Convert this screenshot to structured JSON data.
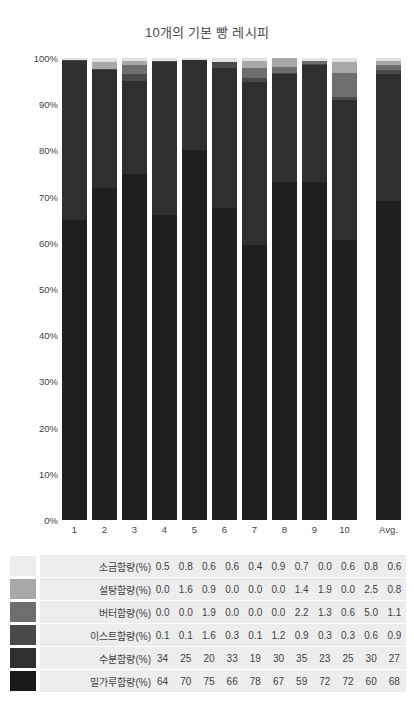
{
  "chart_data": {
    "type": "bar",
    "title": "10개의 기본 빵 레시피",
    "xlabel": "",
    "ylabel": "",
    "ylim": [
      0,
      100
    ],
    "grid": false,
    "stacked": true,
    "normalized": true,
    "legend_position": "bottom-table",
    "categories": [
      "1",
      "2",
      "3",
      "4",
      "5",
      "6",
      "7",
      "8",
      "9",
      "10",
      "Avg."
    ],
    "ytick_labels": [
      "0%",
      "10%",
      "20%",
      "30%",
      "40%",
      "50%",
      "60%",
      "70%",
      "80%",
      "90%",
      "100%"
    ],
    "ytick_values": [
      0,
      10,
      20,
      30,
      40,
      50,
      60,
      70,
      80,
      90,
      100
    ],
    "series": [
      {
        "name": "밀가루함량(%)",
        "color": "#1f1f1f",
        "values": [
          64,
          70,
          75,
          66,
          78,
          67,
          59,
          72,
          72,
          60,
          68
        ]
      },
      {
        "name": "수분함량(%)",
        "color": "#2f2f2f",
        "values": [
          34,
          25,
          20,
          33,
          19,
          30,
          35,
          23,
          25,
          30,
          27
        ]
      },
      {
        "name": "이스트함량(%)",
        "color": "#4a4a4a",
        "values": [
          0.1,
          0.1,
          1.6,
          0.3,
          0.1,
          1.2,
          0.9,
          0.3,
          0.3,
          0.6,
          0.9
        ]
      },
      {
        "name": "버터함량(%)",
        "color": "#6e6e6e",
        "values": [
          0.0,
          0.0,
          1.9,
          0.0,
          0.0,
          0.0,
          2.2,
          1.3,
          0.6,
          5.0,
          1.1
        ]
      },
      {
        "name": "설탕함량(%)",
        "color": "#a8a8a8",
        "values": [
          0.0,
          1.6,
          0.9,
          0.0,
          0.0,
          0.0,
          1.4,
          1.9,
          0.0,
          2.5,
          0.8
        ]
      },
      {
        "name": "소금함량(%)",
        "color": "#e2e2e2",
        "values": [
          0.5,
          0.8,
          0.6,
          0.6,
          0.4,
          0.9,
          0.7,
          0.0,
          0.6,
          0.8,
          0.6
        ]
      }
    ]
  },
  "legend_table": {
    "rows": [
      {
        "label": "소금함량(%)",
        "color": "#ededed",
        "values": [
          "0.5",
          "0.8",
          "0.6",
          "0.6",
          "0.4",
          "0.9",
          "0.7",
          "0.0",
          "0.6",
          "0.8",
          "0.6"
        ]
      },
      {
        "label": "설탕함량(%)",
        "color": "#a8a8a8",
        "values": [
          "0.0",
          "1.6",
          "0.9",
          "0.0",
          "0.0",
          "0.0",
          "1.4",
          "1.9",
          "0.0",
          "2.5",
          "0.8"
        ]
      },
      {
        "label": "버터함량(%)",
        "color": "#6e6e6e",
        "values": [
          "0.0",
          "0.0",
          "1.9",
          "0.0",
          "0.0",
          "0.0",
          "2.2",
          "1.3",
          "0.6",
          "5.0",
          "1.1"
        ]
      },
      {
        "label": "이스트함량(%)",
        "color": "#4a4a4a",
        "values": [
          "0.1",
          "0.1",
          "1.6",
          "0.3",
          "0.1",
          "1.2",
          "0.9",
          "0.3",
          "0.3",
          "0.6",
          "0.9"
        ]
      },
      {
        "label": "수분함량(%)",
        "color": "#2f2f2f",
        "values": [
          "34",
          "25",
          "20",
          "33",
          "19",
          "30",
          "35",
          "23",
          "25",
          "30",
          "27"
        ]
      },
      {
        "label": "밀가루함량(%)",
        "color": "#1a1a1a",
        "values": [
          "64",
          "70",
          "75",
          "66",
          "78",
          "67",
          "59",
          "72",
          "72",
          "60",
          "68"
        ]
      }
    ]
  }
}
